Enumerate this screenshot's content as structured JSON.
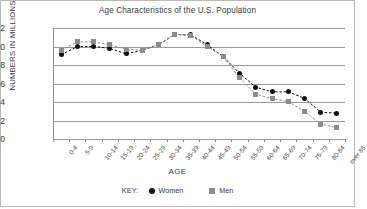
{
  "chart_data": {
    "type": "line",
    "title": "Age Characteristics of the U.S. Population",
    "xlabel": "AGE",
    "ylabel": "NUMBERS IN MILLIONS",
    "ylim": [
      0,
      12
    ],
    "yticks": [
      0,
      2,
      4,
      6,
      8,
      10,
      12
    ],
    "grid": true,
    "legend_position": "bottom",
    "legend_prefix": "KEY:",
    "categories": [
      "0-4",
      "5-9",
      "10-14",
      "15-19",
      "20-24",
      "25-29",
      "30-34",
      "35-39",
      "40-44",
      "45-49",
      "50-54",
      "55-59",
      "60-64",
      "65-69",
      "70-74",
      "75-79",
      "80-84",
      "over 85"
    ],
    "series": [
      {
        "name": "Women",
        "marker": "circle",
        "color": "#111111",
        "values": [
          9.1,
          10.0,
          10.0,
          9.8,
          9.2,
          9.6,
          10.2,
          11.3,
          11.25,
          10.2,
          8.9,
          7.1,
          5.6,
          5.1,
          5.1,
          4.4,
          2.9,
          2.8
        ]
      },
      {
        "name": "Men",
        "marker": "square",
        "color": "#8c8c8c",
        "values": [
          9.6,
          10.5,
          10.5,
          10.2,
          9.7,
          9.6,
          10.2,
          11.3,
          11.2,
          10.0,
          8.9,
          6.6,
          4.85,
          4.35,
          4.05,
          3.0,
          1.6,
          1.25
        ]
      }
    ]
  }
}
